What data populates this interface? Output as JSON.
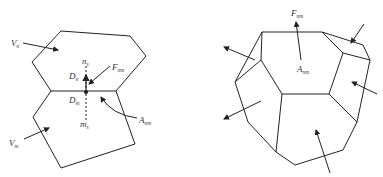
{
  "left_figure": {
    "labels": {
      "V_n": {
        "main": "V",
        "sub": "n"
      },
      "V_m": {
        "main": "V",
        "sub": "m"
      },
      "n_s": {
        "main": "n",
        "sub": "s"
      },
      "m_s": {
        "main": "m",
        "sub": "s"
      },
      "D_n": {
        "main": "D",
        "sub": "n"
      },
      "D_m": {
        "main": "D",
        "sub": "m"
      },
      "F_nm": {
        "main": "F",
        "sub": "nm"
      },
      "A_nm": {
        "main": "A",
        "sub": "nm"
      }
    }
  },
  "right_figure": {
    "labels": {
      "F_nm": {
        "main": "F",
        "sub": "nm"
      },
      "A_nm": {
        "main": "A",
        "sub": "nm"
      }
    }
  },
  "colors": {
    "stroke": "#222222",
    "text": "#333333"
  }
}
